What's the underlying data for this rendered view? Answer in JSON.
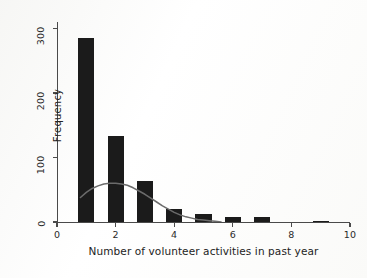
{
  "chart_data": {
    "type": "bar",
    "title": "",
    "subtitle": "",
    "xlabel": "Number of volunteer activities in past year",
    "ylabel": "Frequency",
    "xlim": [
      0,
      10
    ],
    "ylim": [
      0,
      310
    ],
    "xticks": [
      0,
      2,
      4,
      6,
      8,
      10
    ],
    "xtick_labels": [
      "0",
      "2",
      "4",
      "6",
      "8",
      "10"
    ],
    "yticks": [
      0,
      100,
      200,
      300
    ],
    "ytick_labels": [
      "0",
      "100",
      "200",
      "300"
    ],
    "grid": false,
    "legend": null,
    "bar_color": "#1b1b1b",
    "curve_color": "#6b6b6b",
    "bar_width": 0.55,
    "categories": [
      1,
      2,
      3,
      4,
      5,
      6,
      7,
      9
    ],
    "values": [
      285,
      133,
      63,
      20,
      13,
      8,
      8,
      2
    ],
    "series": [
      {
        "name": "Frequency",
        "type": "bar",
        "x": [
          1,
          2,
          3,
          4,
          5,
          6,
          7,
          9
        ],
        "values": [
          285,
          133,
          63,
          20,
          13,
          8,
          8,
          2
        ]
      },
      {
        "name": "Normal curve overlay",
        "type": "line",
        "peak_x": 2.0,
        "peak_y": 60,
        "x_start": 0.8,
        "x_end": 5.6,
        "points": [
          [
            0.8,
            38
          ],
          [
            1.0,
            46
          ],
          [
            1.2,
            52
          ],
          [
            1.4,
            56
          ],
          [
            1.6,
            59
          ],
          [
            1.8,
            60
          ],
          [
            2.0,
            60
          ],
          [
            2.2,
            59
          ],
          [
            2.4,
            57
          ],
          [
            2.6,
            53
          ],
          [
            2.8,
            48
          ],
          [
            3.0,
            43
          ],
          [
            3.2,
            37
          ],
          [
            3.4,
            31
          ],
          [
            3.6,
            25
          ],
          [
            3.8,
            20
          ],
          [
            4.0,
            15
          ],
          [
            4.2,
            11
          ],
          [
            4.4,
            8
          ],
          [
            4.6,
            6
          ],
          [
            4.8,
            4
          ],
          [
            5.0,
            3
          ],
          [
            5.2,
            2
          ],
          [
            5.4,
            1
          ],
          [
            5.6,
            0
          ]
        ]
      }
    ]
  },
  "figure": {
    "background_color": "#fcfcfb",
    "axis_color": "#4a4a4a"
  }
}
